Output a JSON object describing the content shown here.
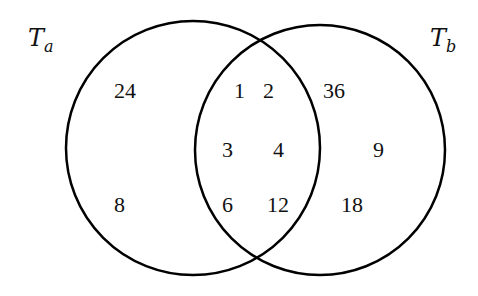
{
  "diagram": {
    "type": "venn",
    "sets": [
      {
        "id": "Ta",
        "label_main": "T",
        "label_sub": "a"
      },
      {
        "id": "Tb",
        "label_main": "T",
        "label_sub": "b"
      }
    ],
    "regions": {
      "only_a": [
        "24",
        "8"
      ],
      "intersection": [
        "1",
        "2",
        "3",
        "4",
        "6",
        "12"
      ],
      "only_b": [
        "36",
        "9",
        "18"
      ]
    }
  }
}
